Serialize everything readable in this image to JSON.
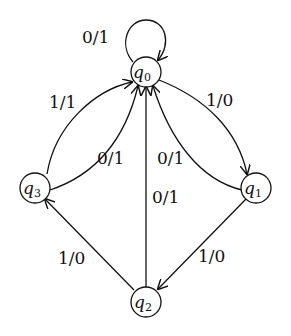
{
  "diagram": {
    "type": "finite-state-machine",
    "nodes": [
      {
        "id": "q0",
        "base": "q",
        "sub": "0"
      },
      {
        "id": "q1",
        "base": "q",
        "sub": "1"
      },
      {
        "id": "q2",
        "base": "q",
        "sub": "2"
      },
      {
        "id": "q3",
        "base": "q",
        "sub": "3"
      }
    ],
    "edges": [
      {
        "from": "q0",
        "to": "q0",
        "label": "0/1"
      },
      {
        "from": "q0",
        "to": "q1",
        "label": "1/0"
      },
      {
        "from": "q1",
        "to": "q0",
        "label": "0/1"
      },
      {
        "from": "q1",
        "to": "q2",
        "label": "1/0"
      },
      {
        "from": "q2",
        "to": "q0",
        "label": "0/1"
      },
      {
        "from": "q2",
        "to": "q3",
        "label": "1/0"
      },
      {
        "from": "q3",
        "to": "q0",
        "label": "1/1"
      },
      {
        "from": "q3",
        "to": "q0",
        "label": "0/1"
      }
    ]
  }
}
